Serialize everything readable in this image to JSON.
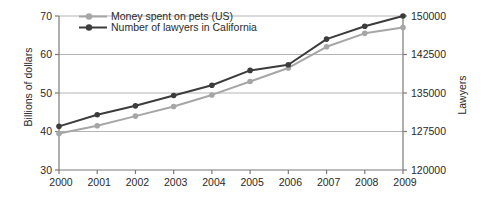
{
  "chart_data": {
    "type": "line",
    "title": "",
    "x_labels": [
      "2000",
      "2001",
      "2002",
      "2003",
      "2004",
      "2005",
      "2006",
      "2007",
      "2008",
      "2009"
    ],
    "series": [
      {
        "name": "Money spent on pets (US)",
        "axis": "left",
        "color": "#a6a6a6",
        "marker": "circle",
        "values": [
          39.5,
          41.5,
          44,
          46.5,
          49.5,
          53,
          56.5,
          62,
          65.5,
          67
        ]
      },
      {
        "name": "Number of lawyers in California",
        "axis": "right",
        "color": "#3c3c3c",
        "marker": "circle",
        "values": [
          128500,
          130750,
          132500,
          134500,
          136500,
          139400,
          140500,
          145500,
          148000,
          150000
        ]
      }
    ],
    "left_axis": {
      "label": "Billions of dollars",
      "range": [
        30,
        70
      ],
      "ticks": [
        30,
        40,
        50,
        60,
        70
      ]
    },
    "right_axis": {
      "label": "Lawyers",
      "range": [
        120000,
        150000
      ],
      "ticks": [
        120000,
        127500,
        135000,
        142500,
        150000
      ]
    },
    "x_axis": {
      "label": ""
    },
    "grid": true,
    "legend_position": "top-left"
  },
  "styles": {
    "background": "#ffffff",
    "grid_color": "#b5b5b5",
    "axis_color": "#7a7a7a",
    "text_color": "#2a2a2a"
  }
}
